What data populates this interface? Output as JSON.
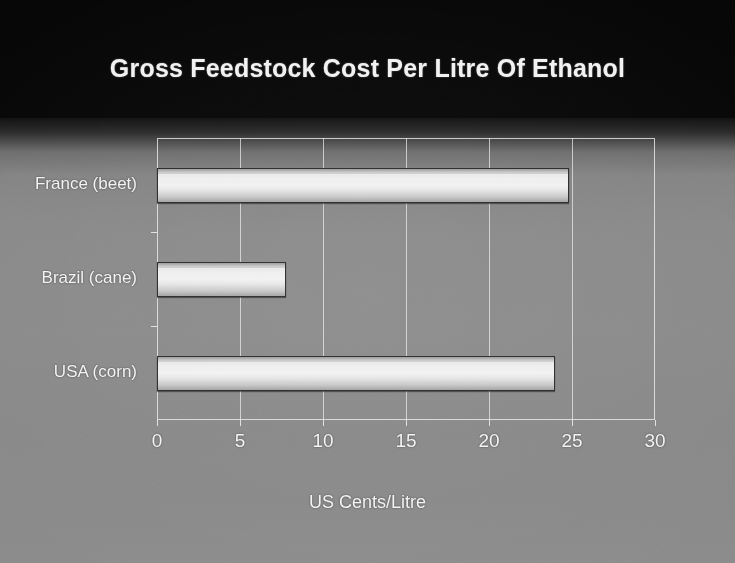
{
  "chart_data": {
    "type": "bar",
    "orientation": "horizontal",
    "title": "Gross Feedstock Cost Per Litre Of Ethanol",
    "xlabel": "US Cents/Litre",
    "ylabel": "",
    "categories": [
      "USA (corn)",
      "Brazil (cane)",
      "France (beet)"
    ],
    "values": [
      24.0,
      7.8,
      24.8
    ],
    "xlim": [
      0,
      30
    ],
    "xticks": [
      0,
      5,
      10,
      15,
      20,
      25,
      30
    ],
    "xtick_labels": [
      "0",
      "5",
      "10",
      "15",
      "20",
      "25",
      "30"
    ],
    "grid": "vertical",
    "legend": "none",
    "series": [
      {
        "name": "Gross feedstock cost",
        "values": [
          24.0,
          7.8,
          24.8
        ]
      }
    ],
    "bar_color": "#eeeeee",
    "background_colors": [
      "#050505",
      "#8a8a8a"
    ],
    "text_color": "#f4f4f4"
  }
}
